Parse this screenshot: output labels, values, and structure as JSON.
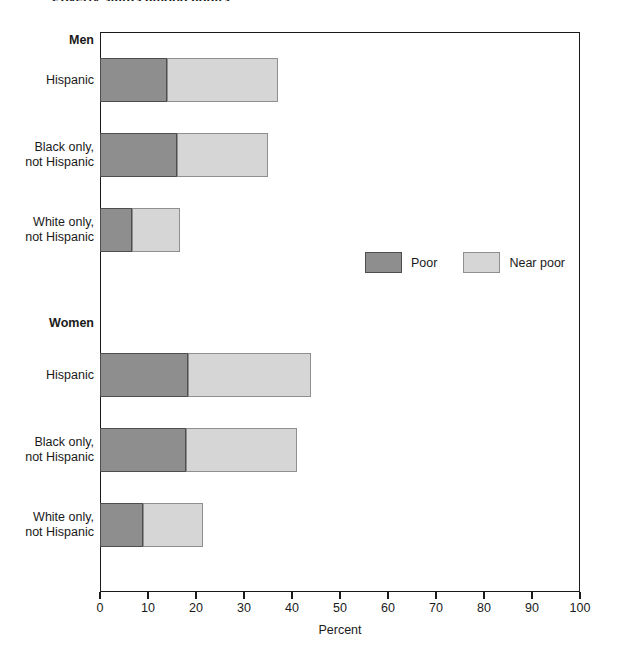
{
  "figure": {
    "title_remnant": "Poverty status among adults",
    "background": "#ffffff"
  },
  "chart_data": {
    "type": "bar",
    "orientation": "horizontal",
    "stacked": true,
    "title": "",
    "xlabel": "Percent",
    "ylabel": "",
    "xlim": [
      0,
      100
    ],
    "xticks": [
      0,
      10,
      20,
      30,
      40,
      50,
      60,
      70,
      80,
      90,
      100
    ],
    "xticklabels": [
      "0",
      "10",
      "20",
      "30",
      "40",
      "50",
      "60",
      "70",
      "80",
      "90",
      "100"
    ],
    "grid": false,
    "legend_position": "center-right",
    "colors": {
      "poor": "#8e8e8e",
      "near_poor": "#d6d6d6",
      "axis": "#1a1a1a"
    },
    "legend": [
      {
        "name": "Poor",
        "color": "#8e8e8e"
      },
      {
        "name": "Near poor",
        "color": "#d6d6d6"
      }
    ],
    "groups": [
      {
        "label": "Men",
        "categories": [
          {
            "label": "Hispanic",
            "label_lines": [
              "Hispanic"
            ],
            "poor": 14.0,
            "near_poor": 23.0,
            "total": 37.0
          },
          {
            "label": "Black only, not Hispanic",
            "label_lines": [
              "Black only,",
              "not Hispanic"
            ],
            "poor": 16.0,
            "near_poor": 19.0,
            "total": 35.0
          },
          {
            "label": "White only, not Hispanic",
            "label_lines": [
              "White only,",
              "not Hispanic"
            ],
            "poor": 6.7,
            "near_poor": 10.0,
            "total": 16.7
          }
        ]
      },
      {
        "label": "Women",
        "categories": [
          {
            "label": "Hispanic",
            "label_lines": [
              "Hispanic"
            ],
            "poor": 18.3,
            "near_poor": 25.7,
            "total": 44.0
          },
          {
            "label": "Black only, not Hispanic",
            "label_lines": [
              "Black only,",
              "not Hispanic"
            ],
            "poor": 18.0,
            "near_poor": 23.0,
            "total": 41.0
          },
          {
            "label": "White only, not Hispanic",
            "label_lines": [
              "White only,",
              "not Hispanic"
            ],
            "poor": 9.0,
            "near_poor": 12.5,
            "total": 21.5
          }
        ]
      }
    ],
    "series": [
      {
        "name": "Poor",
        "values": [
          14.0,
          16.0,
          6.7,
          18.3,
          18.0,
          9.0
        ]
      },
      {
        "name": "Near poor",
        "values": [
          23.0,
          19.0,
          10.0,
          25.7,
          23.0,
          12.5
        ]
      }
    ],
    "categories": [
      "Men - Hispanic",
      "Men - Black only, not Hispanic",
      "Men - White only, not Hispanic",
      "Women - Hispanic",
      "Women - Black only, not Hispanic",
      "Women - White only, not Hispanic"
    ]
  }
}
